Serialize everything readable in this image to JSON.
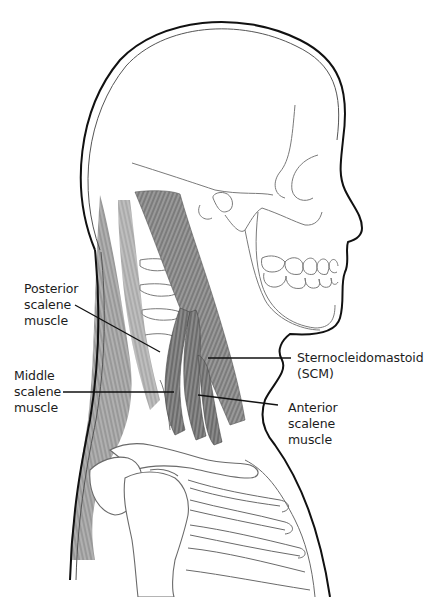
{
  "figure": {
    "colors": {
      "outline": "#111111",
      "bone": "#7a7a7a",
      "muscle": "#8a8a8a",
      "muscle_dark": "#5e5e5e",
      "leader": "#111111",
      "text": "#1c1c1c"
    }
  },
  "labels": [
    {
      "id": "posterior-scalene",
      "text": "Posterior\nscalene\nmuscle"
    },
    {
      "id": "middle-scalene",
      "text": "Middle\nscalene\nmuscle"
    },
    {
      "id": "scm",
      "text": "Sternocleidomastoid\n(SCM)"
    },
    {
      "id": "anterior-scalene",
      "text": "Anterior\nscalene\nmuscle"
    }
  ]
}
